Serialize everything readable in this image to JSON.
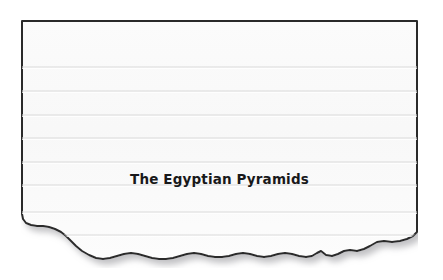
{
  "page": {
    "background_color": "#ffffff",
    "width": 443,
    "height": 280
  },
  "card": {
    "name": "torn-index-card",
    "fill_color": "#fafafa",
    "border_color": "#2b2b2b",
    "rule_line_color": "#d9d9d9",
    "shadow_color": "#b4b4b4",
    "edges": {
      "top": "straight",
      "left": "straight",
      "right": "straight",
      "bottom": "torn"
    },
    "rule_line_count": 8,
    "rule_line_positions": [
      47,
      71,
      95,
      118,
      142,
      165,
      192,
      215
    ],
    "title": "The Egyptian Pyramids",
    "title_color": "#19191b"
  },
  "icons": {
    "card": "note-card-icon",
    "torn_edge": "torn-paper-edge-icon"
  }
}
